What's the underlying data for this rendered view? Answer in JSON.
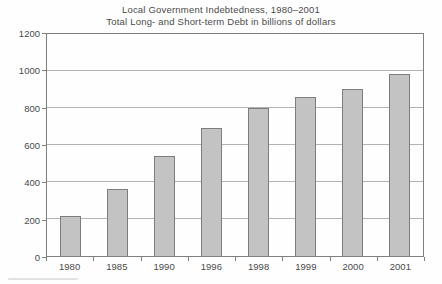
{
  "chart_data": {
    "type": "bar",
    "title": "Local Government Indebtedness, 1980–2001",
    "subtitle": "Total Long- and Short-term Debt in billions of dollars",
    "categories": [
      "1980",
      "1985",
      "1990",
      "1996",
      "1998",
      "1999",
      "2000",
      "2001"
    ],
    "values": [
      215,
      360,
      540,
      690,
      800,
      860,
      905,
      985
    ],
    "xlabel": "",
    "ylabel": "",
    "ylim": [
      0,
      1200
    ],
    "yticks": [
      0,
      200,
      400,
      600,
      800,
      1000,
      1200
    ],
    "grid": "horizontal",
    "legend": "none",
    "bar_fill": "#c3c3c3",
    "bar_border": "#7d7d7d",
    "gridline_color": "#b2b2b2",
    "frame_color": "#7f7f7f",
    "text_color": "#4a4a4a"
  }
}
